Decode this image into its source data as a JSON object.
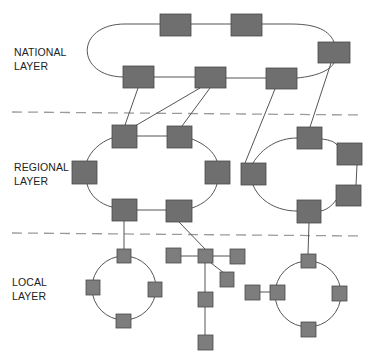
{
  "colors": {
    "node_fill": "#6f6f6f",
    "node_stroke": "#4a4a4a",
    "local_node_fill": "#7d7d7d",
    "link": "#555555",
    "divider": "#9a9a9a",
    "text": "#222222"
  },
  "layers": [
    {
      "id": "national",
      "line1": "NATIONAL",
      "line2": "LAYER"
    },
    {
      "id": "regional",
      "line1": "REGIONAL",
      "line2": "LAYER"
    },
    {
      "id": "local",
      "line1": "LOCAL",
      "line2": "LAYER"
    }
  ],
  "dividers": [
    {
      "x1": 12,
      "y1": 112,
      "x2": 362,
      "y2": 115
    },
    {
      "x1": 12,
      "y1": 233,
      "x2": 362,
      "y2": 236
    }
  ],
  "nodes": {
    "national": [
      {
        "id": "n1",
        "x": 160,
        "y": 14,
        "w": 31,
        "h": 22
      },
      {
        "id": "n2",
        "x": 231,
        "y": 14,
        "w": 31,
        "h": 22
      },
      {
        "id": "n3",
        "x": 318,
        "y": 42,
        "w": 32,
        "h": 21
      },
      {
        "id": "n4",
        "x": 123,
        "y": 66,
        "w": 31,
        "h": 22
      },
      {
        "id": "n5",
        "x": 195,
        "y": 67,
        "w": 31,
        "h": 21
      },
      {
        "id": "n6",
        "x": 266,
        "y": 68,
        "w": 31,
        "h": 21
      }
    ],
    "regional": [
      {
        "id": "r1",
        "x": 112,
        "y": 125,
        "w": 25,
        "h": 23
      },
      {
        "id": "r2",
        "x": 167,
        "y": 126,
        "w": 25,
        "h": 22
      },
      {
        "id": "r3",
        "x": 72,
        "y": 161,
        "w": 25,
        "h": 23
      },
      {
        "id": "r4",
        "x": 205,
        "y": 161,
        "w": 25,
        "h": 23
      },
      {
        "id": "r5",
        "x": 112,
        "y": 199,
        "w": 25,
        "h": 22
      },
      {
        "id": "r6",
        "x": 166,
        "y": 200,
        "w": 26,
        "h": 22
      },
      {
        "id": "r7",
        "x": 241,
        "y": 163,
        "w": 25,
        "h": 22
      },
      {
        "id": "r8",
        "x": 297,
        "y": 127,
        "w": 25,
        "h": 22
      },
      {
        "id": "r9",
        "x": 337,
        "y": 143,
        "w": 25,
        "h": 22
      },
      {
        "id": "r10",
        "x": 336,
        "y": 185,
        "w": 25,
        "h": 21
      },
      {
        "id": "r11",
        "x": 297,
        "y": 200,
        "w": 24,
        "h": 23
      }
    ],
    "local": [
      {
        "id": "l1",
        "x": 117,
        "y": 249,
        "w": 14,
        "h": 14
      },
      {
        "id": "l2",
        "x": 86,
        "y": 280,
        "w": 14,
        "h": 15
      },
      {
        "id": "l3",
        "x": 148,
        "y": 282,
        "w": 14,
        "h": 15
      },
      {
        "id": "l4",
        "x": 116,
        "y": 314,
        "w": 15,
        "h": 14
      },
      {
        "id": "s_hub",
        "x": 198,
        "y": 249,
        "w": 15,
        "h": 14
      },
      {
        "id": "s_left",
        "x": 166,
        "y": 248,
        "w": 15,
        "h": 15
      },
      {
        "id": "s_right",
        "x": 230,
        "y": 249,
        "w": 15,
        "h": 15
      },
      {
        "id": "s_diag",
        "x": 220,
        "y": 272,
        "w": 14,
        "h": 15
      },
      {
        "id": "s_down",
        "x": 198,
        "y": 292,
        "w": 15,
        "h": 15
      },
      {
        "id": "s_bottom",
        "x": 198,
        "y": 335,
        "w": 15,
        "h": 15
      },
      {
        "id": "l5",
        "x": 301,
        "y": 254,
        "w": 15,
        "h": 14
      },
      {
        "id": "l6",
        "x": 270,
        "y": 285,
        "w": 15,
        "h": 15
      },
      {
        "id": "l7",
        "x": 332,
        "y": 286,
        "w": 15,
        "h": 15
      },
      {
        "id": "l8",
        "x": 301,
        "y": 322,
        "w": 15,
        "h": 15
      },
      {
        "id": "l9",
        "x": 245,
        "y": 285,
        "w": 15,
        "h": 15
      }
    ]
  }
}
